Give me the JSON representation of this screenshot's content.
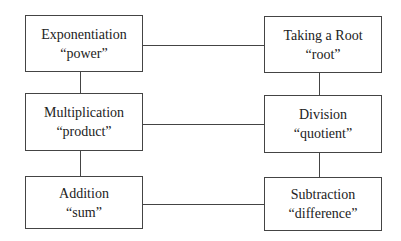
{
  "diagram": {
    "title": "",
    "boxes": {
      "exponentiation": {
        "label": "Exponentiation",
        "term": "“power”"
      },
      "root": {
        "label": "Taking a Root",
        "term": "“root”"
      },
      "multiplication": {
        "label": "Multiplication",
        "term": "“product”"
      },
      "division": {
        "label": "Division",
        "term": "“quotient”"
      },
      "addition": {
        "label": "Addition",
        "term": "“sum”"
      },
      "subtraction": {
        "label": "Subtraction",
        "term": "“difference”"
      }
    },
    "edges": [
      [
        "exponentiation",
        "root"
      ],
      [
        "exponentiation",
        "multiplication"
      ],
      [
        "root",
        "division"
      ],
      [
        "multiplication",
        "division"
      ],
      [
        "multiplication",
        "addition"
      ],
      [
        "division",
        "subtraction"
      ],
      [
        "addition",
        "subtraction"
      ]
    ]
  }
}
